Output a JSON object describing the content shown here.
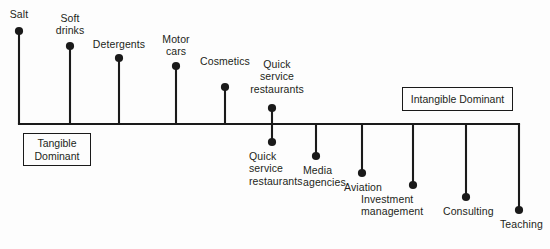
{
  "figure": {
    "axis": {
      "left_x": 19,
      "right_x": 519,
      "y": 124,
      "stroke": "#1a1a1a",
      "stroke_width": 2.1
    },
    "anchors": [
      {
        "id": "tangible-dominant",
        "label": "Tangible\nDominant",
        "x": 23,
        "y": 133,
        "width": 68,
        "height": 33,
        "side": "left"
      },
      {
        "id": "intangible-dominant",
        "label": "Intangible Dominant",
        "x": 402,
        "y": 87,
        "width": 111,
        "height": 24,
        "side": "right"
      }
    ],
    "items": [
      {
        "id": "salt",
        "label": "Salt",
        "x": 19,
        "dot_y": 31,
        "side": "above",
        "label_x": 19,
        "label_y": 8,
        "align": "ctr"
      },
      {
        "id": "soft-drinks",
        "label": "Soft\ndrinks",
        "x": 70,
        "dot_y": 46,
        "side": "above",
        "label_x": 70,
        "label_y": 12,
        "align": "ctr"
      },
      {
        "id": "detergents",
        "label": "Detergents",
        "x": 119,
        "dot_y": 58,
        "side": "above",
        "label_x": 119,
        "label_y": 38,
        "align": "ctr"
      },
      {
        "id": "motor-cars",
        "label": "Motor\ncars",
        "x": 176,
        "dot_y": 66,
        "side": "above",
        "label_x": 176,
        "label_y": 33,
        "align": "ctr"
      },
      {
        "id": "cosmetics",
        "label": "Cosmetics",
        "x": 225,
        "dot_y": 87,
        "side": "above",
        "label_x": 225,
        "label_y": 55,
        "align": "ctr"
      },
      {
        "id": "quick-service-above",
        "label": "Quick\nservice\nrestaurants",
        "x": 272,
        "dot_y": 108,
        "side": "above",
        "label_x": 277,
        "label_y": 58,
        "align": "ctr"
      }
    ],
    "items_below": [
      {
        "id": "quick-service-below",
        "label": "Quick\nservice\nrestaurants",
        "x": 272,
        "dot_y": 142,
        "label_x": 249,
        "label_y": 150,
        "align": "lft"
      },
      {
        "id": "media-agencies",
        "label": "Media\nagencies",
        "x": 316,
        "dot_y": 156,
        "label_x": 303,
        "label_y": 164,
        "align": "lft"
      },
      {
        "id": "aviation",
        "label": "Aviation",
        "x": 362,
        "dot_y": 173,
        "label_x": 344,
        "label_y": 181,
        "align": "lft"
      },
      {
        "id": "investment-management",
        "label": "Investment\nmanagement",
        "x": 413,
        "dot_y": 185,
        "label_x": 361,
        "label_y": 193,
        "align": "lft"
      },
      {
        "id": "consulting",
        "label": "Consulting",
        "x": 466,
        "dot_y": 197,
        "label_x": 443,
        "label_y": 205,
        "align": "lft"
      },
      {
        "id": "teaching",
        "label": "Teaching",
        "x": 519,
        "dot_y": 210,
        "label_x": 500,
        "label_y": 218,
        "align": "lft"
      }
    ],
    "style": {
      "dot_radius": 4.1,
      "dot_color": "#1a1a1a",
      "stem_width": 2.1,
      "text_color": "#231f20",
      "background": "#fdfdfd"
    }
  },
  "chart_data": {
    "type": "scatter",
    "xlabel": "",
    "ylabel": "",
    "grid": false,
    "legend": "none",
    "axis_endpoints": [
      "Tangible Dominant",
      "Intangible Dominant"
    ],
    "categories": [
      "Salt",
      "Soft drinks",
      "Detergents",
      "Motor cars",
      "Cosmetics",
      "Quick service restaurants",
      "Quick service restaurants",
      "Media agencies",
      "Aviation",
      "Investment management",
      "Consulting",
      "Teaching"
    ],
    "x": [
      19,
      70,
      119,
      176,
      225,
      272,
      272,
      316,
      362,
      413,
      466,
      519
    ],
    "y": [
      31,
      46,
      58,
      66,
      87,
      108,
      142,
      156,
      173,
      185,
      197,
      210
    ],
    "sides": [
      "above",
      "above",
      "above",
      "above",
      "above",
      "above",
      "below",
      "below",
      "below",
      "below",
      "below",
      "below"
    ],
    "axis_y": 124,
    "xlim": [
      19,
      519
    ],
    "note": "Stem length above the axis indicates tangibility; stem length below indicates intangibility."
  }
}
